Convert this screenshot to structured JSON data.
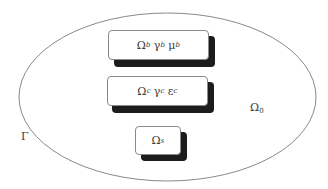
{
  "diagram": {
    "type": "domain-schematic",
    "outer_domain": {
      "symbol": "Ω",
      "subscript": "0",
      "boundary_symbol": "Γ"
    },
    "regions": [
      {
        "id": "b",
        "terms": [
          {
            "symbol": "Ω",
            "subscript": "b"
          },
          {
            "symbol": "γ",
            "subscript": "b"
          },
          {
            "symbol": "μ",
            "subscript": "b"
          }
        ]
      },
      {
        "id": "c",
        "terms": [
          {
            "symbol": "Ω",
            "subscript": "c"
          },
          {
            "symbol": "γ",
            "subscript": "c"
          },
          {
            "symbol": "ε",
            "subscript": "c"
          }
        ]
      },
      {
        "id": "s",
        "terms": [
          {
            "symbol": "Ω",
            "subscript": "s"
          }
        ]
      }
    ],
    "colors": {
      "outline": "#7a7a7a",
      "box_border": "#8a8a8a",
      "shadow": "#1c1c1c",
      "text": "#3a3a3a",
      "background": "#ffffff"
    }
  }
}
